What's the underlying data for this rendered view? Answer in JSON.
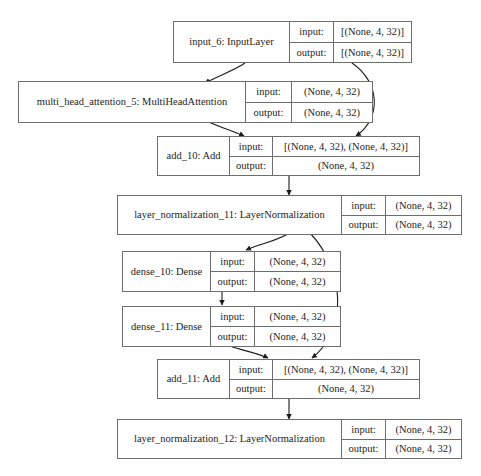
{
  "diagram": {
    "type": "model-graph",
    "row_labels": {
      "input": "input:",
      "output": "output:"
    },
    "style": {
      "border_color": "#6e6e6e",
      "text_color": "#1c1c1c",
      "background": "#ffffff",
      "edge_color": "#1c1c1c"
    },
    "nodes": [
      {
        "id": "input_6",
        "label": "input_6: InputLayer",
        "input": "[(None, 4, 32)]",
        "output": "[(None, 4, 32)]",
        "merged_output": false
      },
      {
        "id": "multi_head_attention_5",
        "label": "multi_head_attention_5: MultiHeadAttention",
        "input": "(None, 4, 32)",
        "output": "(None, 4, 32)",
        "merged_output": false
      },
      {
        "id": "add_10",
        "label": "add_10: Add",
        "input": "[(None, 4, 32), (None, 4, 32)]",
        "output": "(None, 4, 32)",
        "merged_output": true
      },
      {
        "id": "layer_normalization_11",
        "label": "layer_normalization_11: LayerNormalization",
        "input": "(None, 4, 32)",
        "output": "(None, 4, 32)",
        "merged_output": false
      },
      {
        "id": "dense_10",
        "label": "dense_10: Dense",
        "input": "(None, 4, 32)",
        "output": "(None, 4, 32)",
        "merged_output": false
      },
      {
        "id": "dense_11",
        "label": "dense_11: Dense",
        "input": "(None, 4, 32)",
        "output": "(None, 4, 32)",
        "merged_output": false
      },
      {
        "id": "add_11",
        "label": "add_11: Add",
        "input": "[(None, 4, 32), (None, 4, 32)]",
        "output": "(None, 4, 32)",
        "merged_output": true
      },
      {
        "id": "layer_normalization_12",
        "label": "layer_normalization_12: LayerNormalization",
        "input": "(None, 4, 32)",
        "output": "(None, 4, 32)",
        "merged_output": false
      }
    ],
    "edges": [
      {
        "from": "input_6",
        "to": "multi_head_attention_5"
      },
      {
        "from": "input_6",
        "to": "add_10"
      },
      {
        "from": "multi_head_attention_5",
        "to": "add_10"
      },
      {
        "from": "add_10",
        "to": "layer_normalization_11"
      },
      {
        "from": "layer_normalization_11",
        "to": "dense_10"
      },
      {
        "from": "layer_normalization_11",
        "to": "add_11"
      },
      {
        "from": "dense_10",
        "to": "dense_11"
      },
      {
        "from": "dense_11",
        "to": "add_11"
      },
      {
        "from": "add_11",
        "to": "layer_normalization_12"
      }
    ]
  }
}
